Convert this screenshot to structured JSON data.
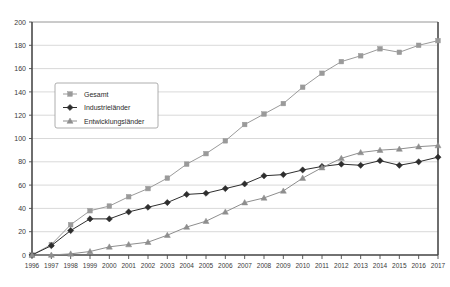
{
  "chart_data": {
    "type": "line",
    "title": "",
    "xlabel": "",
    "ylabel": "",
    "xlim": [
      1996,
      2017
    ],
    "ylim": [
      0,
      200
    ],
    "ytick_step": 20,
    "grid": true,
    "legend_position": "upper-left-inside",
    "categories": [
      "1996",
      "1997",
      "1998",
      "1999",
      "2000",
      "2001",
      "2002",
      "2003",
      "2004",
      "2005",
      "2006",
      "2007",
      "2008",
      "2009",
      "2010",
      "2011",
      "2012",
      "2013",
      "2014",
      "2015",
      "2016",
      "2017"
    ],
    "yticks": [
      "0",
      "20",
      "40",
      "60",
      "80",
      "100",
      "120",
      "140",
      "160",
      "180",
      "200"
    ],
    "series": [
      {
        "name": "Gesamt",
        "marker": "square",
        "color": "#9a9a9a",
        "values": [
          0,
          9,
          26,
          38,
          42,
          50,
          57,
          66,
          78,
          87,
          98,
          112,
          121,
          130,
          144,
          156,
          166,
          171,
          177,
          174,
          180,
          184
        ]
      },
      {
        "name": "Industrieländer",
        "marker": "diamond",
        "color": "#2e2e2e",
        "values": [
          0,
          8,
          21,
          31,
          31,
          37,
          41,
          45,
          52,
          53,
          57,
          61,
          68,
          69,
          73,
          76,
          78,
          77,
          81,
          77,
          80,
          84
        ]
      },
      {
        "name": "Entwicklungsländer",
        "marker": "triangle",
        "color": "#8e8e8e",
        "values": [
          0,
          0,
          1,
          3,
          7,
          9,
          11,
          17,
          24,
          29,
          37,
          45,
          49,
          55,
          66,
          75,
          83,
          88,
          90,
          91,
          93,
          94
        ]
      }
    ]
  },
  "legend": {
    "items": [
      {
        "label": "Gesamt"
      },
      {
        "label": "Industrieländer"
      },
      {
        "label": "Entwicklungsländer"
      }
    ]
  },
  "colors": {
    "gesamt": "#9a9a9a",
    "industrielaender": "#2e2e2e",
    "entwicklungslaender": "#8e8e8e",
    "grid": "#c9c9c9",
    "axis": "#4a4a4a",
    "background": "#ffffff"
  }
}
